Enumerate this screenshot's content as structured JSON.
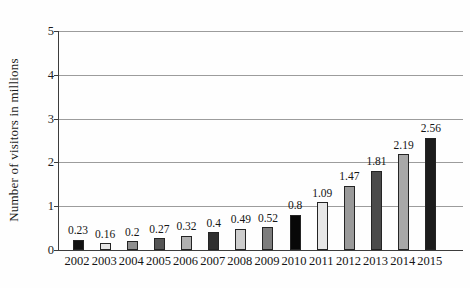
{
  "chart_data": {
    "type": "bar",
    "title": "",
    "xlabel": "",
    "ylabel": "Number of visitors in millions",
    "categories": [
      "2002",
      "2003",
      "2004",
      "2005",
      "2006",
      "2007",
      "2008",
      "2009",
      "2010",
      "2011",
      "2012",
      "2013",
      "2014",
      "2015"
    ],
    "values": [
      0.23,
      0.16,
      0.2,
      0.27,
      0.32,
      0.4,
      0.49,
      0.52,
      0.8,
      1.09,
      1.47,
      1.81,
      2.19,
      2.56
    ],
    "value_labels": [
      "0.23",
      "0.16",
      "0.2",
      "0.27",
      "0.32",
      "0.4",
      "0.49",
      "0.52",
      "0.8",
      "1.09",
      "1.47",
      "1.81",
      "2.19",
      "2.56"
    ],
    "ylim": [
      0,
      5
    ],
    "yticks": [
      0,
      1,
      2,
      3,
      4,
      5
    ],
    "grid": true,
    "legend": false,
    "bar_colors": [
      "#111111",
      "#e4e4e4",
      "#8f8f8f",
      "#555555",
      "#b0b0b0",
      "#2f2f2f",
      "#cdcdcd",
      "#7d7d7d",
      "#080808",
      "#e7e7e7",
      "#9a9a9a",
      "#4b4b4b",
      "#a8a8a8",
      "#1c1c1c"
    ],
    "bar_border_color": "#242424",
    "axis_color": "#3d3d3d",
    "grid_color": "#9c9c9c",
    "text_color": "#1c1c1c"
  }
}
